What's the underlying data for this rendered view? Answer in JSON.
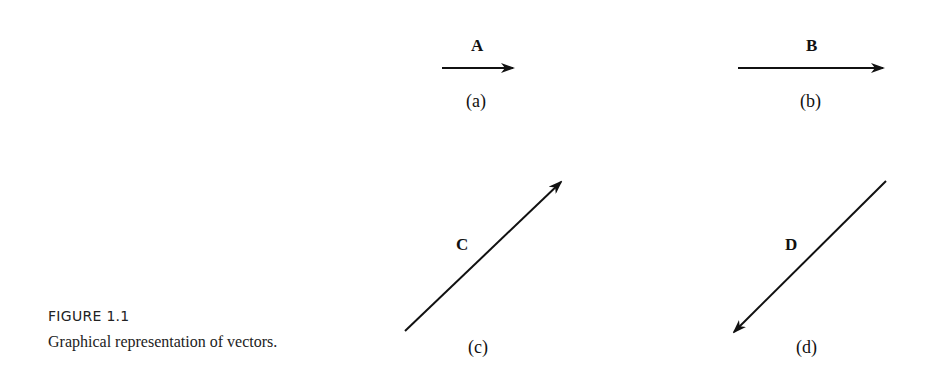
{
  "figure": {
    "title": "FIGURE 1.1",
    "caption": "Graphical representation of vectors."
  },
  "vectors": [
    {
      "name": "A",
      "panel": "(a)",
      "x1": 442,
      "y1": 68,
      "x2": 513,
      "y2": 68
    },
    {
      "name": "B",
      "panel": "(b)",
      "x1": 738,
      "y1": 68,
      "x2": 883,
      "y2": 68
    },
    {
      "name": "C",
      "panel": "(c)",
      "x1": 405,
      "y1": 331,
      "x2": 561,
      "y2": 182
    },
    {
      "name": "D",
      "panel": "(d)",
      "x1": 886,
      "y1": 181,
      "x2": 734,
      "y2": 332
    }
  ],
  "colors": {
    "stroke": "#111111",
    "background": "#ffffff"
  }
}
